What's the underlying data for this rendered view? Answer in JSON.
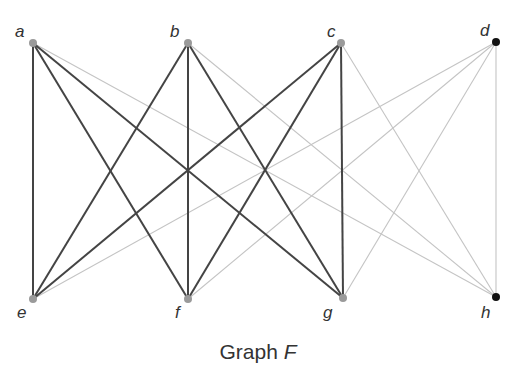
{
  "title": {
    "prefix": "Graph ",
    "variable": "F"
  },
  "colors": {
    "dark_edge": "#444444",
    "light_edge": "#c4c4c4",
    "gray_node": "#9a9a9a",
    "black_node": "#111111"
  },
  "nodes": [
    {
      "id": "a",
      "label": "a",
      "x": 33,
      "y": 43,
      "lx": 15,
      "ly": 37,
      "color": "gray"
    },
    {
      "id": "b",
      "label": "b",
      "x": 188,
      "y": 43,
      "lx": 170,
      "ly": 37,
      "color": "gray"
    },
    {
      "id": "c",
      "label": "c",
      "x": 341,
      "y": 43,
      "lx": 327,
      "ly": 37,
      "color": "gray"
    },
    {
      "id": "d",
      "label": "d",
      "x": 496,
      "y": 42,
      "lx": 480,
      "ly": 36,
      "color": "black"
    },
    {
      "id": "e",
      "label": "e",
      "x": 33,
      "y": 299,
      "lx": 17,
      "ly": 318,
      "color": "gray"
    },
    {
      "id": "f",
      "label": "f",
      "x": 188,
      "y": 299,
      "lx": 175,
      "ly": 318,
      "color": "gray"
    },
    {
      "id": "g",
      "label": "g",
      "x": 343,
      "y": 298,
      "lx": 323,
      "ly": 318,
      "color": "gray"
    },
    {
      "id": "h",
      "label": "h",
      "x": 496,
      "y": 297,
      "lx": 481,
      "ly": 318,
      "color": "black"
    }
  ],
  "edges": [
    {
      "from": "a",
      "to": "e",
      "style": "dark"
    },
    {
      "from": "a",
      "to": "f",
      "style": "dark"
    },
    {
      "from": "a",
      "to": "g",
      "style": "dark"
    },
    {
      "from": "a",
      "to": "h",
      "style": "light"
    },
    {
      "from": "b",
      "to": "e",
      "style": "dark"
    },
    {
      "from": "b",
      "to": "f",
      "style": "dark"
    },
    {
      "from": "b",
      "to": "g",
      "style": "dark"
    },
    {
      "from": "b",
      "to": "h",
      "style": "light"
    },
    {
      "from": "c",
      "to": "e",
      "style": "dark"
    },
    {
      "from": "c",
      "to": "f",
      "style": "dark"
    },
    {
      "from": "c",
      "to": "g",
      "style": "dark"
    },
    {
      "from": "c",
      "to": "h",
      "style": "light"
    },
    {
      "from": "d",
      "to": "e",
      "style": "light"
    },
    {
      "from": "d",
      "to": "f",
      "style": "light"
    },
    {
      "from": "d",
      "to": "g",
      "style": "light"
    },
    {
      "from": "d",
      "to": "h",
      "style": "light"
    }
  ]
}
